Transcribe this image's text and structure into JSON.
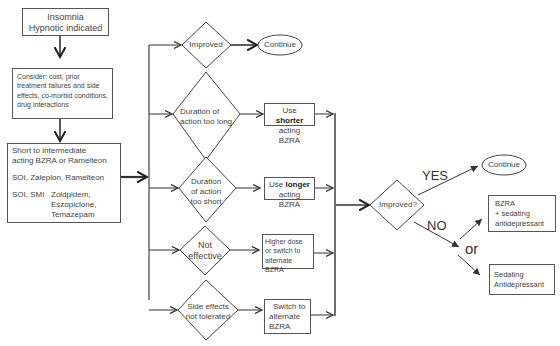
{
  "start": {
    "line1": "Insomnia",
    "line2": "Hypnotic indicated"
  },
  "consider": {
    "text": "Consider: cost, prior treatment failures and side effects, co-morbid conditions, drug interactions"
  },
  "initial_treatment": {
    "heading1": "Short to intermediate",
    "heading2": "acting BZRA or Ramelteon",
    "soi_line": "SOI, Zaleplon, Ramelteon",
    "soi_smi_label": "SOI, SMI",
    "soi_smi_drugs": [
      "Zoldpidem,",
      "Eszopiclone,",
      "Temazepam"
    ]
  },
  "branches": [
    {
      "decision": [
        "Improved"
      ],
      "outcome_type": "ellipse",
      "outcome": [
        "Continue"
      ]
    },
    {
      "decision": [
        "Duration of",
        "action too long"
      ],
      "outcome_pre": "Use ",
      "outcome_bold": "shorter",
      "outcome_post": "acting BZRA"
    },
    {
      "decision": [
        "Duration",
        "of action",
        "too short"
      ],
      "outcome_pre": "Use ",
      "outcome_bold": "longer",
      "outcome_post": "acting BZRA"
    },
    {
      "decision": [
        "Not",
        "effective"
      ],
      "outcome": [
        "Higher dose",
        "or switch to",
        "alternate BZRA"
      ]
    },
    {
      "decision": [
        "Side effects",
        "not tolerated"
      ],
      "outcome": [
        "Switch to",
        "alternate",
        "BZRA"
      ]
    }
  ],
  "final_decision": {
    "question": "Improved?",
    "yes_label": "YES",
    "no_label": "NO",
    "or_label": "or",
    "yes_outcome": "Continue",
    "no_outcomes": [
      [
        "BZRA",
        "+ sedating",
        "antidepressant"
      ],
      [
        "Sedating",
        "Antidepressant"
      ]
    ]
  }
}
